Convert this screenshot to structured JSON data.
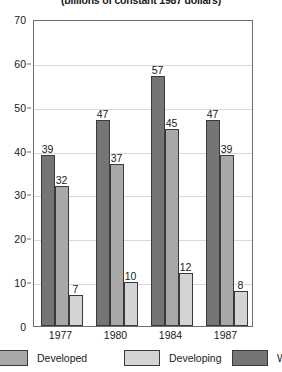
{
  "chart_data": {
    "type": "bar",
    "title": "(billions of constant 1987 dollars)",
    "xlabel": "",
    "ylabel": "",
    "ylim": [
      0,
      70
    ],
    "yticks": [
      0,
      10,
      20,
      30,
      40,
      50,
      60,
      70
    ],
    "grid": true,
    "legend_position": "bottom",
    "categories": [
      "1977",
      "1980",
      "1984",
      "1987"
    ],
    "series": [
      {
        "name": "Developed",
        "color": "#757575",
        "values": [
          39,
          47,
          57,
          47
        ]
      },
      {
        "name": "Developing",
        "color": "#a8a8a8",
        "values": [
          32,
          37,
          45,
          39
        ]
      },
      {
        "name": "Wo",
        "color": "#d4d4d4",
        "values": [
          7,
          10,
          12,
          8
        ]
      }
    ]
  },
  "legend": {
    "items": [
      {
        "label": "Developed",
        "color": "#a8a8a8"
      },
      {
        "label": "Developing",
        "color": "#d4d4d4"
      },
      {
        "label": "Wo",
        "color": "#757575"
      }
    ]
  }
}
